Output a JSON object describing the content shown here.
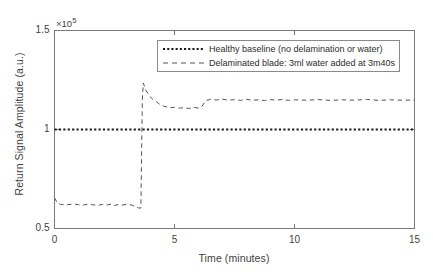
{
  "chart_data": {
    "type": "line",
    "title": "",
    "xlabel": "Time (minutes)",
    "ylabel": "Return Signal Amplitude (a.u.)",
    "y_exponent_label": "×10",
    "y_exponent_power": "5",
    "xlim": [
      0,
      15
    ],
    "ylim": [
      0.5,
      1.5
    ],
    "y_scale_factor": 100000,
    "xticks": [
      0,
      5,
      10,
      15
    ],
    "xticklabels": [
      "0",
      "5",
      "10",
      "15"
    ],
    "yticks": [
      0.5,
      1.0,
      1.5
    ],
    "yticklabels": [
      "0.5",
      "1",
      "1.5"
    ],
    "grid": false,
    "legend_position": "upper center",
    "series": [
      {
        "name": "Healthy baseline (no delamination or water)",
        "linestyle": "dotted",
        "color": "#1a1a1a",
        "x": [
          0,
          15
        ],
        "values": [
          1.0,
          1.0
        ]
      },
      {
        "name": "Delaminated blade: 3ml water added at 3m40s",
        "linestyle": "dashed",
        "color": "#555555",
        "x": [
          0.0,
          0.12,
          0.25,
          0.4,
          0.6,
          0.8,
          1.0,
          1.2,
          1.4,
          1.6,
          1.8,
          2.0,
          2.2,
          2.4,
          2.5,
          2.65,
          2.8,
          3.0,
          3.2,
          3.35,
          3.5,
          3.6,
          3.63,
          3.66,
          3.7,
          3.8,
          3.95,
          4.1,
          4.25,
          4.4,
          4.55,
          4.7,
          4.85,
          5.0,
          5.2,
          5.4,
          5.6,
          5.8,
          6.0,
          6.15,
          6.3,
          6.5,
          6.75,
          7.0,
          7.25,
          7.5,
          7.75,
          8.0,
          8.25,
          8.5,
          8.75,
          9.0,
          9.25,
          9.5,
          9.75,
          10.0,
          10.5,
          11.0,
          11.5,
          12.0,
          12.5,
          13.0,
          13.5,
          14.0,
          14.5,
          15.0
        ],
        "values": [
          0.655,
          0.628,
          0.622,
          0.62,
          0.621,
          0.624,
          0.62,
          0.618,
          0.623,
          0.62,
          0.617,
          0.622,
          0.619,
          0.624,
          0.616,
          0.621,
          0.618,
          0.622,
          0.619,
          0.612,
          0.604,
          0.603,
          0.9,
          1.15,
          1.235,
          1.2,
          1.17,
          1.152,
          1.14,
          1.126,
          1.118,
          1.113,
          1.11,
          1.112,
          1.108,
          1.11,
          1.106,
          1.112,
          1.108,
          1.118,
          1.146,
          1.152,
          1.149,
          1.153,
          1.148,
          1.151,
          1.147,
          1.152,
          1.148,
          1.15,
          1.146,
          1.151,
          1.148,
          1.152,
          1.147,
          1.15,
          1.148,
          1.151,
          1.147,
          1.15,
          1.148,
          1.152,
          1.147,
          1.15,
          1.148,
          1.149
        ]
      }
    ],
    "annotations": []
  },
  "legend": {
    "items": [
      {
        "label": "Healthy baseline (no delamination or water)",
        "style": "dotted"
      },
      {
        "label": "Delaminated blade: 3ml water added at 3m40s",
        "style": "dashed"
      }
    ]
  },
  "colors": {
    "frame": "#7a7a7a",
    "baseline": "#1a1a1a",
    "signal": "#555555",
    "text": "#3f3f3f",
    "background": "#ffffff"
  }
}
